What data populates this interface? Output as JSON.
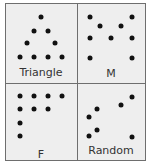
{
  "panels": [
    {
      "label": "Triangle",
      "label_pos": [
        41,
        67
      ],
      "dots": [
        [
          41,
          17
        ],
        [
          34,
          31
        ],
        [
          48,
          31
        ],
        [
          27,
          43
        ],
        [
          55,
          43
        ],
        [
          20,
          57
        ],
        [
          34,
          57
        ],
        [
          48,
          57
        ],
        [
          62,
          57
        ]
      ]
    },
    {
      "label": "M",
      "label_pos": [
        111,
        68
      ],
      "dots": [
        [
          90,
          17
        ],
        [
          100,
          26
        ],
        [
          121,
          26
        ],
        [
          132,
          17
        ],
        [
          90,
          38
        ],
        [
          111,
          38
        ],
        [
          132,
          38
        ],
        [
          90,
          58
        ],
        [
          132,
          58
        ]
      ]
    },
    {
      "label": "F",
      "label_pos": [
        41,
        149
      ],
      "dots": [
        [
          20,
          96
        ],
        [
          34,
          96
        ],
        [
          48,
          96
        ],
        [
          62,
          96
        ],
        [
          20,
          109
        ],
        [
          34,
          109
        ],
        [
          48,
          109
        ],
        [
          20,
          123
        ],
        [
          20,
          136
        ]
      ]
    },
    {
      "label": "Random",
      "label_pos": [
        111,
        145
      ],
      "dots": [
        [
          132,
          97
        ],
        [
          121,
          105
        ],
        [
          97,
          109
        ],
        [
          89,
          117
        ],
        [
          97,
          130
        ],
        [
          89,
          136
        ],
        [
          132,
          137
        ]
      ]
    }
  ],
  "colors": {
    "background": "#eeeeee",
    "border": "#6e6e6e",
    "dot": "#111111"
  }
}
